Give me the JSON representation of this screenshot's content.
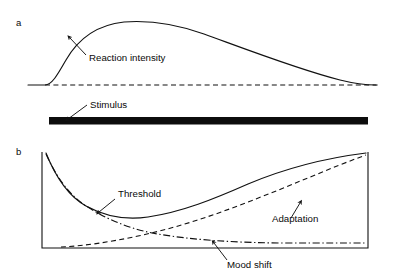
{
  "figure": {
    "background_color": "#ffffff",
    "ink_color": "#111111",
    "width": 397,
    "height": 280
  },
  "panels": [
    {
      "id": "panel-a",
      "letter": "a",
      "letter_pos": {
        "x": 16,
        "y": 26
      },
      "annotations": [
        {
          "id": "reaction-intensity",
          "text": "Reaction intensity",
          "text_pos": {
            "x": 89,
            "y": 61
          },
          "leader": "M 86 55 L 70 38",
          "arrow_at": {
            "x": 68,
            "y": 36
          },
          "arrow_angle": -133
        },
        {
          "id": "stimulus",
          "text": "Stimulus",
          "text_pos": {
            "x": 90,
            "y": 108
          },
          "leader": "M 87 105 L 68 119",
          "arrow_at": {
            "x": 66,
            "y": 120
          },
          "arrow_angle": 144
        }
      ],
      "curves": [
        {
          "id": "reaction-intensity-curve",
          "style": "solid",
          "path": "M 28 85 L 45 85 C 52 85 58 74 66 60 C 78 39 96 25 124 22 C 150 20 176 24 204 34 C 248 50 300 70 340 80 C 356 84 366 85 376 85"
        },
        {
          "id": "baseline-dashed",
          "style": "dashed",
          "path": "M 45 85 L 378 85"
        }
      ],
      "bar": {
        "id": "stimulus-bar",
        "x": 49,
        "y": 117,
        "width": 319,
        "height": 7.5
      }
    },
    {
      "id": "panel-b",
      "letter": "b",
      "letter_pos": {
        "x": 16,
        "y": 155
      },
      "frame": {
        "id": "axis-frame",
        "path": "M 42 152 L 42 248 L 368 248 L 368 152"
      },
      "annotations": [
        {
          "id": "threshold",
          "text": "Threshold",
          "text_pos": {
            "x": 118,
            "y": 197
          },
          "leader": "M 115 199 L 99 212",
          "arrow_at": {
            "x": 97,
            "y": 214
          },
          "arrow_angle": 140
        },
        {
          "id": "adaptation",
          "text": "Adaptation",
          "text_pos": {
            "x": 272,
            "y": 222
          },
          "leader": "M 291 218 L 300 203",
          "arrow_at": {
            "x": 301,
            "y": 200
          },
          "arrow_angle": -59
        },
        {
          "id": "mood-shift",
          "text": "Mood shift",
          "text_pos": {
            "x": 227,
            "y": 268
          },
          "leader": "M 227 260 L 214 243",
          "arrow_at": {
            "x": 212,
            "y": 241
          },
          "arrow_angle": -127
        }
      ],
      "curves": [
        {
          "id": "threshold-curve",
          "style": "solid",
          "path": "M 46 153 C 56 178 68 196 86 206 C 108 218 128 220 148 217 C 182 212 214 199 248 184 C 286 168 326 158 366 153"
        },
        {
          "id": "adaptation-curve",
          "style": "dashed",
          "path": "M 61 247 C 84 246 110 242 138 236 C 176 228 212 216 248 202 C 290 186 330 168 366 155"
        },
        {
          "id": "mood-shift-curve",
          "style": "dashdot",
          "path": "M 46 154 C 56 176 68 194 86 206 C 106 219 128 228 152 233 C 190 240 238 243 290 243 C 320 243 346 243 366 243"
        }
      ]
    }
  ]
}
